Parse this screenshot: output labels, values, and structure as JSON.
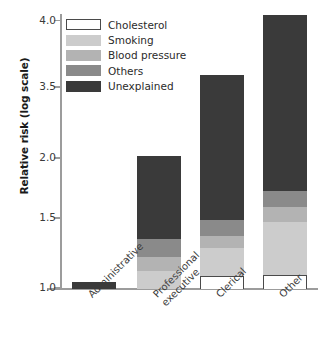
{
  "chart_data": {
    "type": "bar",
    "title": "",
    "xlabel": "",
    "ylabel": "Relative risk (log scale)",
    "ylim": [
      1.0,
      4.0
    ],
    "yticks": [
      1.0,
      1.5,
      2.0,
      3.5,
      4.0
    ],
    "ytick_labels": [
      "1.0",
      "1.5",
      "2.0",
      "3.5",
      "4.0"
    ],
    "y_scale": "log",
    "grid": false,
    "legend_position": "upper left",
    "stacked": true,
    "categories": [
      "Administrative",
      "Professional\nexecutive",
      "Clerical",
      "Other"
    ],
    "category_labels_flat": [
      "Administrative",
      "Professional executive",
      "Clerical",
      "Other"
    ],
    "series": [
      {
        "name": "Cholesterol",
        "color": "#ffffff",
        "values": [
          0.0,
          0.0,
          0.09,
          0.1
        ]
      },
      {
        "name": "Smoking",
        "color": "#cccccc",
        "values": [
          0.0,
          0.13,
          0.2,
          0.38
        ]
      },
      {
        "name": "Blood pressure",
        "color": "#b3b3b3",
        "values": [
          0.0,
          0.1,
          0.09,
          0.12
        ]
      },
      {
        "name": "Others",
        "color": "#8a8a8a",
        "values": [
          0.0,
          0.13,
          0.11,
          0.13
        ]
      },
      {
        "name": "Unexplained",
        "color": "#3a3a3a",
        "values": [
          0.05,
          0.71,
          2.11,
          2.32
        ]
      }
    ],
    "totals": [
      1.05,
      2.07,
      3.6,
      4.05
    ]
  },
  "legend": {
    "items": [
      {
        "label": "Cholesterol"
      },
      {
        "label": "Smoking"
      },
      {
        "label": "Blood pressure"
      },
      {
        "label": "Others"
      },
      {
        "label": "Unexplained"
      }
    ]
  }
}
